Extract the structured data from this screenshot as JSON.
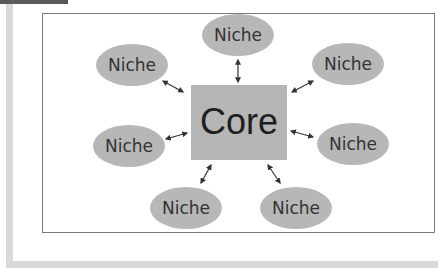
{
  "diagram": {
    "type": "hub-and-spoke",
    "colors": {
      "node_fill": "#b7b7b7",
      "core_fill": "#b5b5b5",
      "arrow": "#333333",
      "frame_border": "#7a7a7a",
      "accent_bars": "#d9d9d9"
    },
    "core": {
      "label": "Core"
    },
    "niches": [
      {
        "id": "top",
        "label": "Niche"
      },
      {
        "id": "top-left",
        "label": "Niche"
      },
      {
        "id": "top-right",
        "label": "Niche"
      },
      {
        "id": "middle-left",
        "label": "Niche"
      },
      {
        "id": "middle-right",
        "label": "Niche"
      },
      {
        "id": "bottom-left",
        "label": "Niche"
      },
      {
        "id": "bottom-right",
        "label": "Niche"
      }
    ],
    "edges": [
      {
        "from": "core",
        "to": "top",
        "style": "double-arrow"
      },
      {
        "from": "core",
        "to": "top-left",
        "style": "double-arrow"
      },
      {
        "from": "core",
        "to": "top-right",
        "style": "double-arrow"
      },
      {
        "from": "core",
        "to": "middle-left",
        "style": "double-arrow"
      },
      {
        "from": "core",
        "to": "middle-right",
        "style": "double-arrow"
      },
      {
        "from": "core",
        "to": "bottom-left",
        "style": "double-arrow"
      },
      {
        "from": "core",
        "to": "bottom-right",
        "style": "double-arrow"
      }
    ]
  }
}
